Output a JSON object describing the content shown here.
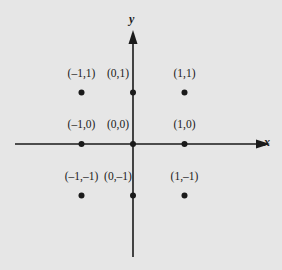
{
  "chart_data": {
    "type": "scatter",
    "title": "",
    "xlabel": "x",
    "ylabel": "y",
    "grid": false,
    "xlim": [
      -2.3,
      2.6
    ],
    "ylim": [
      -2.2,
      2.2
    ],
    "points": [
      {
        "x": -1,
        "y": 1,
        "label": "(–1,1)"
      },
      {
        "x": 0,
        "y": 1,
        "label": "(0,1)"
      },
      {
        "x": 1,
        "y": 1,
        "label": "(1,1)"
      },
      {
        "x": -1,
        "y": 0,
        "label": "(–1,0)"
      },
      {
        "x": 0,
        "y": 0,
        "label": "(0,0)"
      },
      {
        "x": 1,
        "y": 0,
        "label": "(1,0)"
      },
      {
        "x": -1,
        "y": -1,
        "label": "(–1,–1)"
      },
      {
        "x": 0,
        "y": -1,
        "label": "(0,–1)"
      },
      {
        "x": 1,
        "y": -1,
        "label": "(1,–1)"
      }
    ]
  },
  "axes": {
    "x_label": "x",
    "y_label": "y"
  },
  "colors": {
    "background": "#e6e6e6",
    "ink": "#1a1a1a"
  }
}
